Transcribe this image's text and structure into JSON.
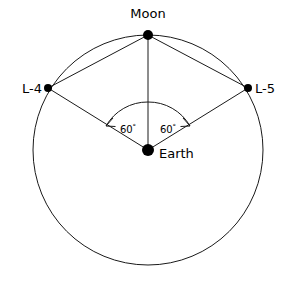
{
  "diagram": {
    "background_color": "#ffffff",
    "line_color": "#1a1a1a",
    "dot_color": "#000000",
    "orbit": {
      "center_x": 148,
      "center_y": 150,
      "radius": 115,
      "label": "Moon orbit"
    },
    "bodies": [
      {
        "id": "moon",
        "label": "Moon",
        "x": 148,
        "y": 35,
        "dot_radius": 5,
        "label_x": 148,
        "label_y": 18,
        "label_anchor": "middle"
      },
      {
        "id": "earth",
        "label": "Earth",
        "x": 148,
        "y": 150,
        "dot_radius": 6,
        "label_x": 159,
        "label_y": 158,
        "label_anchor": "start"
      },
      {
        "id": "l4",
        "label": "L-4",
        "x": 48,
        "y": 88,
        "dot_radius": 4,
        "label_x": 42,
        "label_y": 93,
        "label_anchor": "end"
      },
      {
        "id": "l5",
        "label": "L-5",
        "x": 248,
        "y": 88,
        "dot_radius": 4,
        "label_x": 255,
        "label_y": 93,
        "label_anchor": "start"
      }
    ],
    "connections": [
      {
        "name": "earth-to-moon",
        "from": "earth",
        "to": "moon"
      },
      {
        "name": "earth-to-l4",
        "from": "earth",
        "to": "l4"
      },
      {
        "name": "earth-to-l5",
        "from": "earth",
        "to": "l5"
      },
      {
        "name": "moon-to-l4",
        "from": "moon",
        "to": "l4"
      },
      {
        "name": "moon-to-l5",
        "from": "moon",
        "to": "l5"
      }
    ],
    "angles": [
      {
        "id": "angle-left",
        "value": "60",
        "unit": "°",
        "between": [
          "earth-to-l4",
          "earth-to-moon"
        ],
        "label_x": 128,
        "label_y": 133
      },
      {
        "id": "angle-right",
        "value": "60",
        "unit": "°",
        "between": [
          "earth-to-moon",
          "earth-to-l5"
        ],
        "label_x": 168,
        "label_y": 133
      }
    ]
  }
}
